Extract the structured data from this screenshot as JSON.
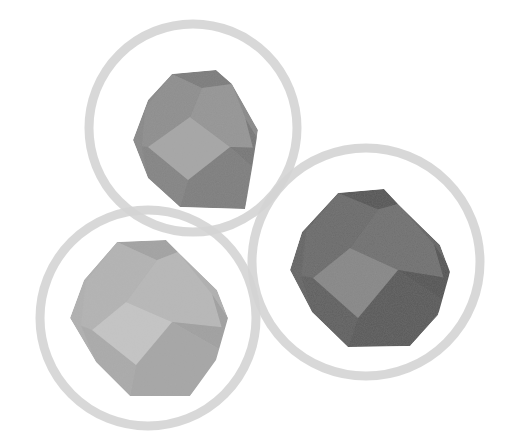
{
  "scene": {
    "title": "Three truncated octahedra in rings",
    "background": "#ffffff",
    "ring_color": "#d4d4d4",
    "ring_width": 9
  },
  "shapes": [
    {
      "name": "top",
      "ring": {
        "cx": 193,
        "cy": 128,
        "r": 104
      },
      "tone": "medium",
      "faces": {
        "top": "#7c7c7c",
        "upper_left": "#8e8e8e",
        "upper_right": "#959595",
        "front": "#a6a6a6",
        "lower_left": "#848484",
        "lower_right": "#7e7e7e",
        "right": "#777777",
        "left": "#898989"
      },
      "outline": [
        [
          172,
          74
        ],
        [
          216,
          70
        ],
        [
          232,
          84
        ],
        [
          258,
          130
        ],
        [
          252,
          168
        ],
        [
          245,
          209
        ],
        [
          180,
          207
        ],
        [
          148,
          178
        ],
        [
          133,
          140
        ],
        [
          148,
          100
        ]
      ],
      "square": [
        [
          148,
          147
        ],
        [
          190,
          117
        ],
        [
          230,
          147
        ],
        [
          188,
          180
        ]
      ]
    },
    {
      "name": "right",
      "ring": {
        "cx": 366,
        "cy": 262,
        "r": 114
      },
      "tone": "dark",
      "faces": {
        "top": "#555555",
        "upper_left": "#6a6a6a",
        "upper_right": "#707070",
        "front": "#878787",
        "lower_left": "#5f5f5f",
        "lower_right": "#595959",
        "right": "#525252",
        "left": "#646464"
      },
      "outline": [
        [
          338,
          193
        ],
        [
          384,
          189
        ],
        [
          398,
          204
        ],
        [
          440,
          245
        ],
        [
          450,
          272
        ],
        [
          438,
          315
        ],
        [
          410,
          346
        ],
        [
          348,
          347
        ],
        [
          312,
          312
        ],
        [
          290,
          270
        ],
        [
          302,
          232
        ]
      ],
      "square": [
        [
          313,
          278
        ],
        [
          350,
          248
        ],
        [
          398,
          270
        ],
        [
          358,
          318
        ]
      ]
    },
    {
      "name": "bottom-left",
      "ring": {
        "cx": 148,
        "cy": 318,
        "r": 108
      },
      "tone": "light",
      "faces": {
        "top": "#a3a3a3",
        "upper_left": "#b3b3b3",
        "upper_right": "#b8b8b8",
        "front": "#c4c4c4",
        "lower_left": "#aaaaaa",
        "lower_right": "#a6a6a6",
        "right": "#a0a0a0",
        "left": "#b0b0b0"
      },
      "outline": [
        [
          117,
          242
        ],
        [
          166,
          240
        ],
        [
          178,
          252
        ],
        [
          217,
          290
        ],
        [
          228,
          318
        ],
        [
          216,
          360
        ],
        [
          190,
          396
        ],
        [
          130,
          396
        ],
        [
          96,
          362
        ],
        [
          70,
          318
        ],
        [
          84,
          280
        ]
      ],
      "square": [
        [
          92,
          330
        ],
        [
          126,
          302
        ],
        [
          172,
          322
        ],
        [
          136,
          365
        ]
      ]
    }
  ]
}
